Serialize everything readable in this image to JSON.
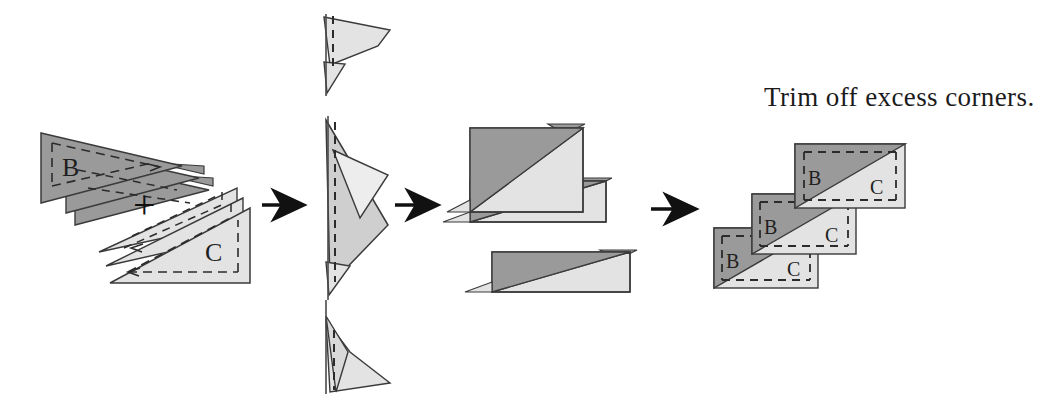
{
  "figure": {
    "kind": "quilting-piecing-step-diagram",
    "background_color": "#ffffff",
    "width": 1054,
    "height": 407,
    "caption": "Trim off excess corners.",
    "plus_symbol": "+",
    "labels": {
      "dark_piece": "B",
      "light_piece": "C"
    },
    "colors": {
      "dark_fabric": "#9a9a9a",
      "light_fabric": "#e3e3e3",
      "outline": "#3a3a3a",
      "dashed_seam": "#2b2b2b",
      "arrow": "#111111",
      "text": "#1b1b1b",
      "page": "#ffffff"
    }
  },
  "panels": [
    {
      "id": "panel-1",
      "name": "stacked-triangle-inputs",
      "description": "Stack of dark B triangles plus stack of light C triangles",
      "dark_stack_label": "B",
      "light_stack_label": "C",
      "operator": "+",
      "dark_layers": 3,
      "light_layers": 3
    },
    {
      "id": "panel-2",
      "name": "edge-on-stitched-stack",
      "description": "Edge-on view of layered triangles along a vertical stitching line",
      "clusters": 3,
      "stitch_line": "dashed"
    },
    {
      "id": "panel-3",
      "name": "opened-units-with-dog-ears",
      "description": "Opened pieced rectangles showing excess corner points",
      "units": 3
    },
    {
      "id": "panel-4",
      "name": "trimmed-units",
      "description": "Finished half-rectangle units after trimming",
      "units": 3,
      "unit_labels": [
        {
          "dark": "B",
          "light": "C"
        },
        {
          "dark": "B",
          "light": "C"
        },
        {
          "dark": "B",
          "light": "C"
        }
      ]
    }
  ],
  "arrows": [
    {
      "id": "arrow-1",
      "name": "arrow-panel1-to-panel2"
    },
    {
      "id": "arrow-2",
      "name": "arrow-panel2-to-panel3"
    },
    {
      "id": "arrow-3",
      "name": "arrow-panel3-to-panel4"
    }
  ]
}
